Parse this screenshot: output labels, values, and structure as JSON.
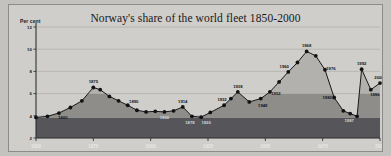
{
  "figure": {
    "title": "Norway's share of the world fleet 1850-2000",
    "ylabel": "Per cent"
  },
  "axes": {
    "y_ticks": [
      "12",
      "10",
      "8",
      "6",
      "4",
      "2"
    ],
    "x_ticks": [
      "1850",
      "1875",
      "1900",
      "1925",
      "1950",
      "1975",
      "2000"
    ]
  },
  "chart_data": {
    "type": "area",
    "title": "Norway's share of the world fleet 1850-2000",
    "xlabel": "",
    "ylabel": "Per cent",
    "xlim": [
      1850,
      2000
    ],
    "ylim": [
      2,
      12
    ],
    "grid": true,
    "legend": null,
    "bands": [
      {
        "name": "lower-band",
        "from": 2,
        "to": 3.85,
        "color": "#55555a"
      },
      {
        "name": "middle-band",
        "from": 3.85,
        "to": 6.0,
        "color": "#8e8d8a"
      },
      {
        "name": "upper-band",
        "from": 6.0,
        "to": 12,
        "color": "#b2b1ad"
      }
    ],
    "series": [
      {
        "name": "Norway's share of the world fleet",
        "x": [
          1850,
          1855,
          1860,
          1865,
          1870,
          1875,
          1878,
          1882,
          1886,
          1890,
          1894,
          1898,
          1902,
          1906,
          1910,
          1914,
          1918,
          1922,
          1926,
          1932,
          1935,
          1938,
          1943,
          1948,
          1952,
          1956,
          1960,
          1964,
          1968,
          1972,
          1976,
          1980,
          1984,
          1987,
          1990,
          1992,
          1996,
          2000
        ],
        "y": [
          3.85,
          3.95,
          4.25,
          4.75,
          5.35,
          6.55,
          6.35,
          5.75,
          5.35,
          4.95,
          4.5,
          4.35,
          4.4,
          4.35,
          4.45,
          4.8,
          3.95,
          3.88,
          4.3,
          4.95,
          5.55,
          6.15,
          5.25,
          5.55,
          6.15,
          7.05,
          7.95,
          8.8,
          9.8,
          9.4,
          8.15,
          5.65,
          4.45,
          4.2,
          3.95,
          8.2,
          6.35,
          6.95
        ],
        "labels": [
          {
            "x": 1860,
            "text": "1860",
            "dx": 4,
            "dy": 6
          },
          {
            "x": 1875,
            "text": "1875",
            "dx": 0,
            "dy": -4
          },
          {
            "x": 1890,
            "text": "1890",
            "dx": 6,
            "dy": -2
          },
          {
            "x": 1906,
            "text": "1900",
            "dx": 0,
            "dy": 7,
            "light": true
          },
          {
            "x": 1914,
            "text": "1914",
            "dx": 0,
            "dy": -4
          },
          {
            "x": 1918,
            "text": "1878",
            "dx": -2,
            "dy": 8,
            "light": true
          },
          {
            "x": 1922,
            "text": "1920",
            "dx": 5,
            "dy": 7,
            "light": true
          },
          {
            "x": 1932,
            "text": "1932",
            "dx": -2,
            "dy": -4
          },
          {
            "x": 1938,
            "text": "1938",
            "dx": 0,
            "dy": -4
          },
          {
            "x": 1948,
            "text": "1948",
            "dx": 2,
            "dy": 8
          },
          {
            "x": 1952,
            "text": "1952",
            "dx": 6,
            "dy": 3
          },
          {
            "x": 1960,
            "text": "1960",
            "dx": -4,
            "dy": -4
          },
          {
            "x": 1968,
            "text": "1968",
            "dx": 0,
            "dy": -4
          },
          {
            "x": 1976,
            "text": "1976",
            "dx": 6,
            "dy": 0
          },
          {
            "x": 1980,
            "text": "1980",
            "dx": -7,
            "dy": 2
          },
          {
            "x": 1987,
            "text": "1987",
            "dx": -1,
            "dy": 8,
            "light": true
          },
          {
            "x": 1992,
            "text": "1992",
            "dx": 0,
            "dy": -4
          },
          {
            "x": 1996,
            "text": "1996",
            "dx": 4,
            "dy": 6
          },
          {
            "x": 2000,
            "text": "2000",
            "dx": -1,
            "dy": -4
          }
        ]
      }
    ]
  },
  "colors": {
    "plate_background": "#cfcecb",
    "upper_band": "#b2b1ad",
    "middle_band": "#8e8d8a",
    "lower_band": "#55555a",
    "line": "#18181b",
    "marker": "#121215"
  }
}
